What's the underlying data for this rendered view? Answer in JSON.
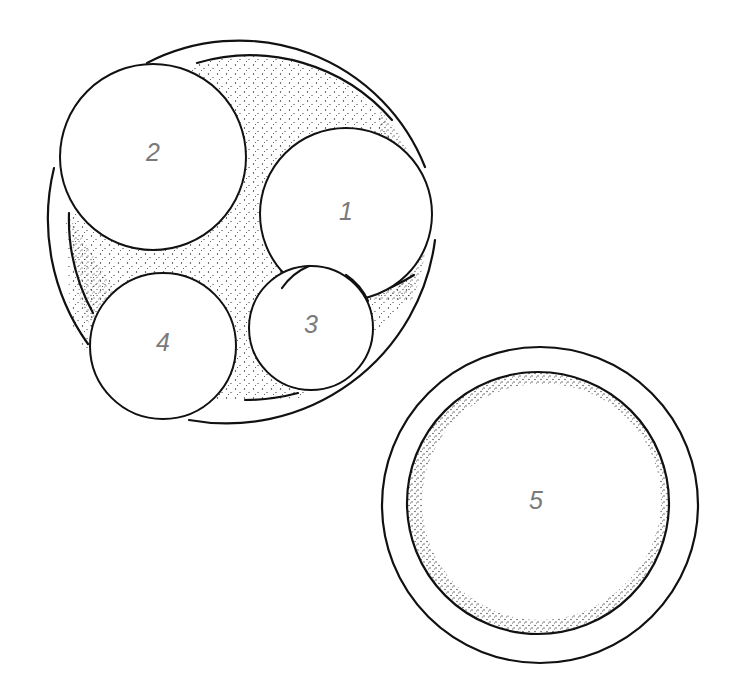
{
  "diagram": {
    "type": "cross-section illustration",
    "colors": {
      "line": "#111111",
      "label": "#7a7a7a",
      "stipple": "#222222",
      "background": "#ffffff"
    },
    "groups": [
      {
        "name": "cluster",
        "description": "Outer ring containing stippled matrix with four circles",
        "circles": [
          {
            "id": "1",
            "label": "1"
          },
          {
            "id": "2",
            "label": "2"
          },
          {
            "id": "3",
            "label": "3"
          },
          {
            "id": "4",
            "label": "4"
          }
        ]
      },
      {
        "name": "single",
        "description": "Double-ring circle with stippled rim",
        "circles": [
          {
            "id": "5",
            "label": "5"
          }
        ]
      }
    ]
  }
}
